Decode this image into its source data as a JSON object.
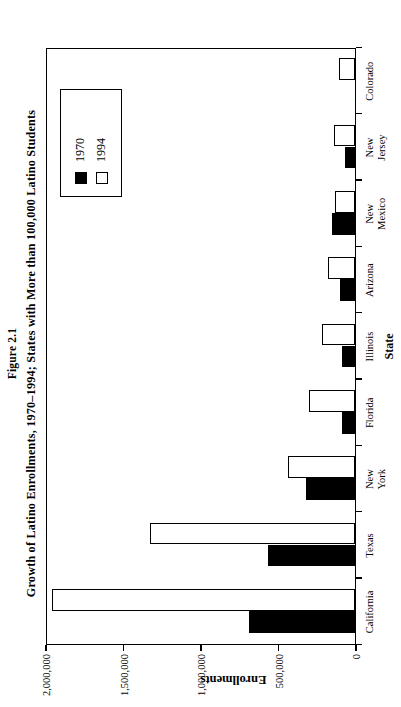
{
  "figure": {
    "number": "Figure 2.1",
    "caption": "Growth of Latino Enrollments, 1970–1994; States with More than 100,000 Latino Students"
  },
  "legend": {
    "position": "top-left-of-plot",
    "entries": [
      {
        "label": "1970",
        "swatch": "filled-black-square",
        "color": "#000000"
      },
      {
        "label": "1994",
        "swatch": "open-white-square",
        "color": "#ffffff"
      }
    ]
  },
  "chart_data": {
    "type": "bar",
    "orientation": "vertical",
    "title": "Growth of Latino Enrollments, 1970–1994; States with More than 100,000 Latino Students",
    "xlabel": "State",
    "ylabel": "Enrollments",
    "ylim": [
      0,
      2000000
    ],
    "yticks": [
      0,
      500000,
      1000000,
      1500000,
      2000000
    ],
    "ytick_labels": [
      "0",
      "500,000",
      "1,000,000",
      "1,500,000",
      "2,000,000"
    ],
    "grid": false,
    "legend_position": "upper right",
    "categories": [
      "California",
      "Texas",
      "New York",
      "Florida",
      "Illinois",
      "Arizona",
      "New Mexico",
      "New Jersey",
      "Colorado"
    ],
    "series": [
      {
        "name": "1970",
        "color": "#000000",
        "values": [
          684000,
          560000,
          315000,
          84000,
          84000,
          97000,
          148000,
          65000,
          0
        ]
      },
      {
        "name": "1994",
        "color": "#ffffff",
        "values": [
          1955000,
          1320000,
          430000,
          297000,
          213000,
          174000,
          129000,
          135000,
          103000
        ]
      }
    ]
  }
}
